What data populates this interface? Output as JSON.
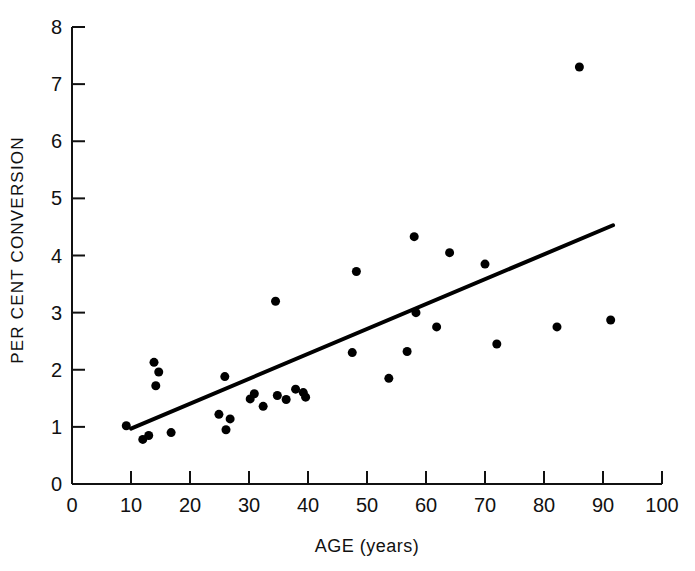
{
  "figure": {
    "background": "#ffffff",
    "ink_color": "#111111"
  },
  "axes": {
    "x_title": "AGE (years)",
    "y_title": "PER CENT CONVERSION",
    "x_ticks": [
      "0",
      "10",
      "20",
      "30",
      "40",
      "50",
      "60",
      "70",
      "80",
      "90",
      "100"
    ],
    "y_ticks": [
      "0",
      "1",
      "2",
      "3",
      "4",
      "5",
      "6",
      "7",
      "8"
    ]
  },
  "caption": {
    "text": ""
  },
  "chart_data": {
    "type": "scatter",
    "title": "",
    "xlabel": "AGE (years)",
    "ylabel": "PER CENT CONVERSION",
    "xlim": [
      0,
      100
    ],
    "ylim": [
      0,
      8
    ],
    "xticks": [
      0,
      10,
      20,
      30,
      40,
      50,
      60,
      70,
      80,
      90,
      100
    ],
    "yticks": [
      0,
      1,
      2,
      3,
      4,
      5,
      6,
      7,
      8
    ],
    "grid": false,
    "legend": null,
    "marker": {
      "shape": "circle",
      "color": "#000000",
      "size_px": 9
    },
    "points": [
      {
        "x": 9.2,
        "y": 1.02
      },
      {
        "x": 12.0,
        "y": 0.78
      },
      {
        "x": 13.0,
        "y": 0.85
      },
      {
        "x": 13.9,
        "y": 2.13
      },
      {
        "x": 14.7,
        "y": 1.96
      },
      {
        "x": 14.2,
        "y": 1.72
      },
      {
        "x": 16.8,
        "y": 0.9
      },
      {
        "x": 24.9,
        "y": 1.22
      },
      {
        "x": 25.9,
        "y": 1.88
      },
      {
        "x": 26.8,
        "y": 1.14
      },
      {
        "x": 26.1,
        "y": 0.95
      },
      {
        "x": 30.2,
        "y": 1.49
      },
      {
        "x": 30.9,
        "y": 1.58
      },
      {
        "x": 32.4,
        "y": 1.36
      },
      {
        "x": 34.5,
        "y": 3.2
      },
      {
        "x": 34.8,
        "y": 1.55
      },
      {
        "x": 36.3,
        "y": 1.48
      },
      {
        "x": 37.9,
        "y": 1.66
      },
      {
        "x": 39.2,
        "y": 1.6
      },
      {
        "x": 39.6,
        "y": 1.52
      },
      {
        "x": 47.5,
        "y": 2.3
      },
      {
        "x": 48.2,
        "y": 3.72
      },
      {
        "x": 53.7,
        "y": 1.85
      },
      {
        "x": 56.8,
        "y": 2.32
      },
      {
        "x": 58.0,
        "y": 4.33
      },
      {
        "x": 58.3,
        "y": 3.0
      },
      {
        "x": 61.8,
        "y": 2.75
      },
      {
        "x": 64.0,
        "y": 4.05
      },
      {
        "x": 70.0,
        "y": 3.85
      },
      {
        "x": 72.0,
        "y": 2.45
      },
      {
        "x": 82.2,
        "y": 2.75
      },
      {
        "x": 86.0,
        "y": 7.3
      },
      {
        "x": 91.3,
        "y": 2.87
      }
    ],
    "fit_line": {
      "label": "regression line",
      "x_start": 10.0,
      "y_start": 0.97,
      "x_end": 91.7,
      "y_end": 4.53,
      "width_px": 4,
      "color": "#000000"
    }
  }
}
